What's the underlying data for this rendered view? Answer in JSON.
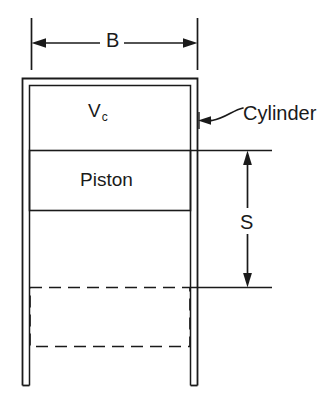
{
  "diagram": {
    "stroke_color": "#1a1a1a",
    "background_color": "#ffffff",
    "labels": {
      "bore": "B",
      "clearance_volume": "V",
      "clearance_volume_subscript": "c",
      "piston": "Piston",
      "stroke": "S",
      "cylinder": "Cylinder"
    },
    "icons": {
      "bore_dimension": "horizontal-double-arrow-icon",
      "stroke_dimension": "vertical-double-arrow-icon",
      "cylinder_leader": "curved-leader-arrow-icon"
    },
    "parts": {
      "cylinder_wall": "cylinder-wall",
      "piston_tdc": "piston-rectangle",
      "piston_bdc": "piston-bdc-dashed-rectangle",
      "clearance_space": "clearance-volume-region"
    }
  }
}
